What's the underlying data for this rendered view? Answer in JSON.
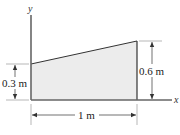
{
  "diagram": {
    "type": "trapezoidal plate area on x-y axes",
    "axes": {
      "x_label": "x",
      "y_label": "y"
    },
    "shape": {
      "fill": "#ececec",
      "stroke": "#333333",
      "left_height_label": "0.3 m",
      "right_height_label": "0.6 m",
      "width_label": "1 m"
    }
  }
}
